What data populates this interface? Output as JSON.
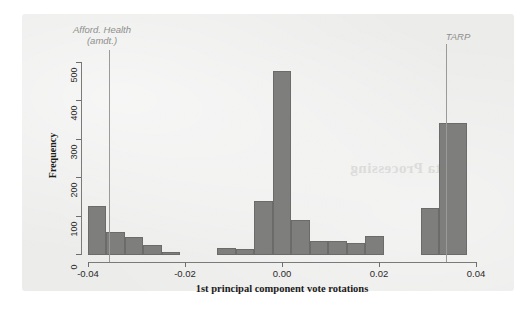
{
  "figure": {
    "background_color": "#ececeb",
    "bar_color": "#7e7e7c",
    "bar_edge_color": "#6b6b69",
    "axis_color": "#6e6e6c",
    "annotation_color": "#8e8e8c"
  },
  "chart_data": {
    "type": "bar",
    "chart_subtype": "histogram",
    "title": "",
    "xlabel": "1st principal component vote rotations",
    "ylabel": "Frequency",
    "xlim": [
      -0.042,
      0.042
    ],
    "ylim": [
      0,
      520
    ],
    "grid": false,
    "legend": "none",
    "bin_width": 0.004,
    "xticks": [
      -0.04,
      -0.02,
      0.0,
      0.02,
      0.04
    ],
    "xtick_labels": [
      "-0.04",
      "-0.02",
      "0.00",
      "0.02",
      "0.04"
    ],
    "yticks": [
      0,
      100,
      200,
      300,
      400,
      500
    ],
    "ytick_labels": [
      "0",
      "100",
      "200",
      "300",
      "400",
      "500"
    ],
    "bins": [
      {
        "x0": -0.042,
        "x1": -0.038,
        "value": 130
      },
      {
        "x0": -0.038,
        "x1": -0.034,
        "value": 60
      },
      {
        "x0": -0.034,
        "x1": -0.03,
        "value": 48
      },
      {
        "x0": -0.03,
        "x1": -0.026,
        "value": 27
      },
      {
        "x0": -0.026,
        "x1": -0.022,
        "value": 7
      },
      {
        "x0": -0.022,
        "x1": -0.018,
        "value": 0
      },
      {
        "x0": -0.018,
        "x1": -0.014,
        "value": 0
      },
      {
        "x0": -0.014,
        "x1": -0.01,
        "value": 18
      },
      {
        "x0": -0.01,
        "x1": -0.006,
        "value": 15
      },
      {
        "x0": -0.006,
        "x1": -0.002,
        "value": 143
      },
      {
        "x0": -0.002,
        "x1": 0.002,
        "value": 485
      },
      {
        "x0": 0.002,
        "x1": 0.006,
        "value": 92
      },
      {
        "x0": 0.006,
        "x1": 0.01,
        "value": 37
      },
      {
        "x0": 0.01,
        "x1": 0.014,
        "value": 38
      },
      {
        "x0": 0.014,
        "x1": 0.018,
        "value": 33
      },
      {
        "x0": 0.018,
        "x1": 0.022,
        "value": 50
      },
      {
        "x0": 0.022,
        "x1": 0.026,
        "value": 0
      },
      {
        "x0": 0.026,
        "x1": 0.03,
        "value": 0
      },
      {
        "x0": 0.03,
        "x1": 0.034,
        "value": 125
      },
      {
        "x0": 0.034,
        "x1": 0.04,
        "value": 348
      }
    ],
    "annotations": [
      {
        "label": "Afford. Health\n(amdt.)",
        "label_line1": "Afford. Health",
        "label_line2": "(amdt.)",
        "x": -0.0375,
        "orientation": "vertical-line"
      },
      {
        "label": "TARP",
        "label_line1": "TARP",
        "label_line2": "",
        "x": 0.0355,
        "orientation": "vertical-line"
      }
    ]
  },
  "ghost_text": {
    "line1": "Data Processing"
  }
}
